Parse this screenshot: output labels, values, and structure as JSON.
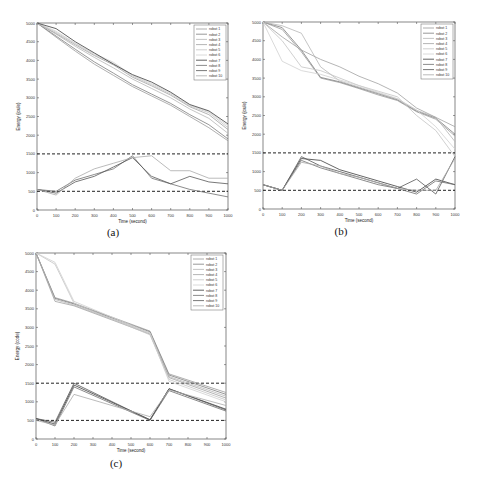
{
  "figure": {
    "captions": [
      "(a)",
      "(b)",
      "(c)"
    ]
  },
  "chart_data": [
    {
      "id": "a",
      "type": "line",
      "caption": "(a)",
      "xlabel": "Time (second)",
      "ylabel": "Energy (joule)",
      "xlim": [
        0,
        1000
      ],
      "ylim": [
        0,
        5000
      ],
      "xticks": [
        0,
        100,
        200,
        300,
        400,
        500,
        600,
        700,
        800,
        900,
        1000
      ],
      "yticks": [
        0,
        500,
        1000,
        1500,
        2000,
        2500,
        3000,
        3500,
        4000,
        4500,
        5000
      ],
      "grid": false,
      "legend_position": "upper right",
      "thresholds": [
        1500,
        500
      ],
      "x": [
        0,
        100,
        200,
        300,
        400,
        500,
        600,
        700,
        800,
        900,
        1000
      ],
      "series": [
        {
          "name": "robot 1",
          "values": [
            5000,
            4620,
            4250,
            3900,
            3600,
            3300,
            3050,
            2800,
            2500,
            2200,
            1850
          ]
        },
        {
          "name": "robot 2",
          "values": [
            5000,
            4650,
            4300,
            3960,
            3660,
            3350,
            3100,
            2850,
            2550,
            2280,
            1900
          ]
        },
        {
          "name": "robot 3",
          "values": [
            5000,
            4700,
            4380,
            4080,
            3800,
            3500,
            3250,
            3000,
            2700,
            2450,
            2050
          ]
        },
        {
          "name": "robot 4",
          "values": [
            5000,
            4720,
            4420,
            4130,
            3880,
            3550,
            3320,
            3070,
            2760,
            2550,
            2150
          ]
        },
        {
          "name": "robot 5",
          "values": [
            5000,
            4750,
            4450,
            4150,
            3920,
            3580,
            3350,
            3100,
            2780,
            2600,
            2200
          ]
        },
        {
          "name": "robot 6",
          "values": [
            5000,
            4780,
            4460,
            4180,
            3950,
            3600,
            3380,
            3130,
            2800,
            2630,
            2250
          ]
        },
        {
          "name": "robot 7",
          "values": [
            5000,
            4850,
            4500,
            4200,
            3900,
            3620,
            3420,
            3150,
            2820,
            2650,
            2300
          ]
        },
        {
          "name": "robot 8",
          "values": [
            550,
            500,
            800,
            950,
            1100,
            1450,
            850,
            700,
            550,
            450,
            350
          ]
        },
        {
          "name": "robot 9",
          "values": [
            550,
            450,
            750,
            900,
            1150,
            1400,
            900,
            700,
            900,
            750,
            700
          ]
        },
        {
          "name": "robot 10",
          "values": [
            550,
            400,
            850,
            1100,
            1250,
            1400,
            1450,
            1050,
            1050,
            850,
            850
          ]
        }
      ]
    },
    {
      "id": "b",
      "type": "line",
      "caption": "(b)",
      "xlabel": "Time (second)",
      "ylabel": "Energy (joule)",
      "xlim": [
        0,
        1000
      ],
      "ylim": [
        0,
        5000
      ],
      "xticks": [
        0,
        100,
        200,
        300,
        400,
        500,
        600,
        700,
        800,
        900,
        1000
      ],
      "yticks": [
        0,
        500,
        1000,
        1500,
        2000,
        2500,
        3000,
        3500,
        4000,
        4500,
        5000
      ],
      "grid": false,
      "legend_position": "upper right",
      "thresholds": [
        1500,
        500
      ],
      "x": [
        0,
        100,
        200,
        300,
        400,
        500,
        600,
        700,
        800,
        900,
        1000
      ],
      "series": [
        {
          "name": "robot 1",
          "values": [
            5000,
            4800,
            4200,
            3500,
            3380,
            3220,
            3050,
            2900,
            2600,
            2400,
            1950
          ]
        },
        {
          "name": "robot 2",
          "values": [
            5000,
            4850,
            4250,
            3520,
            3400,
            3240,
            3080,
            2920,
            2620,
            2430,
            2000
          ]
        },
        {
          "name": "robot 3",
          "values": [
            5000,
            4900,
            4700,
            3800,
            3420,
            3260,
            3100,
            2940,
            2640,
            2450,
            1800
          ]
        },
        {
          "name": "robot 4",
          "values": [
            5000,
            4600,
            4250,
            4000,
            3800,
            3550,
            3350,
            3100,
            2700,
            2450,
            2200
          ]
        },
        {
          "name": "robot 5",
          "values": [
            5000,
            4500,
            3800,
            3700,
            3500,
            3300,
            3150,
            3000,
            2500,
            2100,
            1400
          ]
        },
        {
          "name": "robot 6",
          "values": [
            5000,
            3950,
            3700,
            3600,
            3450,
            3300,
            3120,
            2950,
            2650,
            2200,
            1600
          ]
        },
        {
          "name": "robot 7",
          "values": [
            650,
            500,
            1350,
            1300,
            1050,
            900,
            750,
            600,
            450,
            800,
            650
          ]
        },
        {
          "name": "robot 8",
          "values": [
            650,
            500,
            1300,
            1100,
            950,
            800,
            650,
            550,
            400,
            750,
            650
          ]
        },
        {
          "name": "robot 9",
          "values": [
            650,
            500,
            1400,
            1150,
            1000,
            850,
            700,
            550,
            800,
            400,
            1400
          ]
        },
        {
          "name": "robot 10",
          "values": [
            650,
            500,
            1250,
            1150,
            950,
            850,
            700,
            550,
            500,
            500,
            1350
          ]
        }
      ]
    },
    {
      "id": "c",
      "type": "line",
      "caption": "(c)",
      "xlabel": "Time (second)",
      "ylabel": "Energy (code)",
      "xlim": [
        0,
        1000
      ],
      "ylim": [
        0,
        5000
      ],
      "xticks": [
        0,
        100,
        200,
        300,
        400,
        500,
        600,
        700,
        800,
        900,
        1000
      ],
      "yticks": [
        0,
        500,
        1000,
        1500,
        2000,
        2500,
        3000,
        3500,
        4000,
        4500,
        5000
      ],
      "grid": false,
      "legend_position": "upper right",
      "thresholds": [
        1500,
        500
      ],
      "x": [
        0,
        100,
        200,
        600,
        700,
        1000
      ],
      "series": [
        {
          "name": "robot 1",
          "values": [
            5000,
            3800,
            3650,
            2900,
            1750,
            1250
          ]
        },
        {
          "name": "robot 2",
          "values": [
            5000,
            3780,
            3630,
            2880,
            1720,
            1200
          ]
        },
        {
          "name": "robot 3",
          "values": [
            5000,
            3750,
            3600,
            2850,
            1680,
            1150
          ]
        },
        {
          "name": "robot 4",
          "values": [
            5000,
            3700,
            3580,
            2820,
            1650,
            1100
          ]
        },
        {
          "name": "robot 5",
          "values": [
            5000,
            4700,
            3650,
            2800,
            1600,
            1050
          ]
        },
        {
          "name": "robot 6",
          "values": [
            5000,
            4750,
            3700,
            2850,
            1550,
            1000
          ]
        },
        {
          "name": "robot 7",
          "values": [
            550,
            400,
            1450,
            520,
            1350,
            800
          ]
        },
        {
          "name": "robot 8",
          "values": [
            550,
            350,
            1400,
            500,
            1300,
            750
          ]
        },
        {
          "name": "robot 9",
          "values": [
            550,
            450,
            1500,
            510,
            1350,
            780
          ]
        },
        {
          "name": "robot 10",
          "values": [
            500,
            380,
            1200,
            600,
            1320,
            900
          ]
        }
      ]
    }
  ],
  "panels": [
    {
      "left": 37,
      "top": 23,
      "width": 191,
      "height": 187,
      "legend": {
        "x": 157,
        "y": 2
      },
      "caption_x": 113,
      "caption_y": 226
    },
    {
      "left": 263,
      "top": 22,
      "width": 192,
      "height": 187,
      "legend": {
        "x": 158,
        "y": 2
      },
      "caption_x": 341,
      "caption_y": 225
    },
    {
      "left": 36,
      "top": 253,
      "width": 190,
      "height": 186,
      "legend": {
        "x": 155,
        "y": 2
      },
      "caption_x": 116,
      "caption_y": 457
    }
  ],
  "colors": [
    "#9a9a9a",
    "#7e7e7e",
    "#b6b6b6",
    "#a2a2a2",
    "#c4c4c4",
    "#d0d0d0",
    "#3e3e3e",
    "#6e6e6e",
    "#575757",
    "#aaaaaa"
  ]
}
